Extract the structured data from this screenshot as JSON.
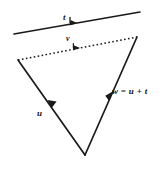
{
  "figure": {
    "type": "vector-diagram",
    "background_color": "#ffffff",
    "stroke_color": "#1a1a1a",
    "labels": {
      "t": "t",
      "v": "v",
      "u": "u",
      "w_expression": "w = u + t"
    },
    "vectors": [
      {
        "name": "t",
        "label": "t",
        "style": "solid",
        "from": [
          14,
          34
        ],
        "to": [
          140,
          12
        ],
        "arrow_position": "midpoint",
        "arrow_direction": "up-right"
      },
      {
        "name": "v",
        "label": "v",
        "style": "dotted",
        "from": [
          18,
          60
        ],
        "to": [
          137,
          37
        ],
        "arrow_position": "midpoint",
        "arrow_direction": "up-right"
      },
      {
        "name": "u",
        "label": "u",
        "style": "solid",
        "from": [
          85,
          155
        ],
        "to": [
          18,
          60
        ],
        "arrow_position": "midpoint",
        "arrow_direction": "up-left"
      },
      {
        "name": "w",
        "label": "w = u + t",
        "style": "solid",
        "from": [
          85,
          155
        ],
        "to": [
          137,
          37
        ],
        "arrow_position": "midpoint",
        "arrow_direction": "up-right"
      }
    ],
    "vertices": {
      "left": [
        18,
        60
      ],
      "bottom": [
        85,
        155
      ],
      "right": [
        137,
        37
      ]
    }
  }
}
